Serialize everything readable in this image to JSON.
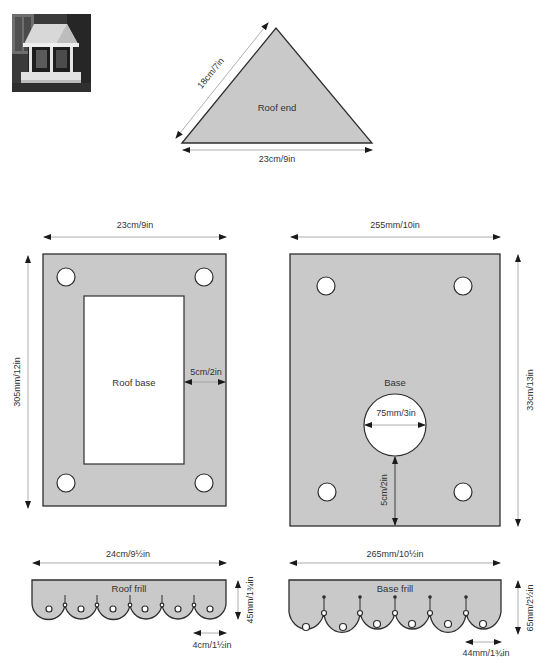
{
  "photo": {
    "alt": "Completed bird table with pitched roof and scalloped frills"
  },
  "roof_end": {
    "label": "Roof end",
    "side_dim": "18cm/7in",
    "base_dim": "23cm/9in"
  },
  "roof_base": {
    "label": "Roof base",
    "width_dim": "23cm/9in",
    "height_dim": "305mm/12in",
    "border_dim": "5cm/2in"
  },
  "base": {
    "label": "Base",
    "width_dim": "255mm/10in",
    "height_dim": "33cm/13in",
    "hole_dim": "75mm/3in",
    "hole_offset_dim": "5cm/2in"
  },
  "roof_frill": {
    "label": "Roof frill",
    "width_dim": "24cm/9½in",
    "height_dim": "45mm/1¾in",
    "scallop_dim": "4cm/1½in"
  },
  "base_frill": {
    "label": "Base frill",
    "width_dim": "265mm/10½in",
    "height_dim": "65mm/2½in",
    "scallop_dim": "44mm/1¾in"
  },
  "colors": {
    "piece_fill": "#c9c9c9",
    "outline": "#2e2e2e",
    "dimension_line": "#9a9a9a"
  }
}
